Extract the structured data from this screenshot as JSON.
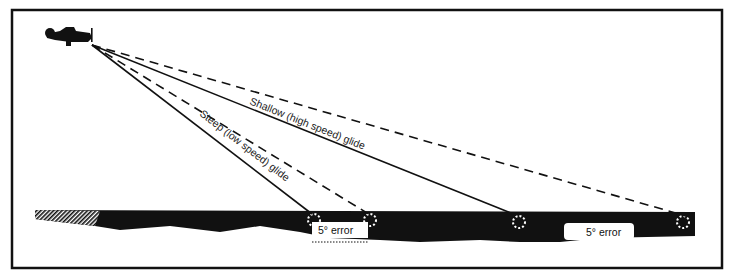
{
  "diagram": {
    "labels": {
      "shallow": "Shallow (high speed) glide",
      "steep": "Steep (low speed) glide",
      "error_left": "5° error",
      "error_right": "5° error"
    },
    "colors": {
      "ink": "#111111",
      "paper": "#ffffff"
    }
  }
}
